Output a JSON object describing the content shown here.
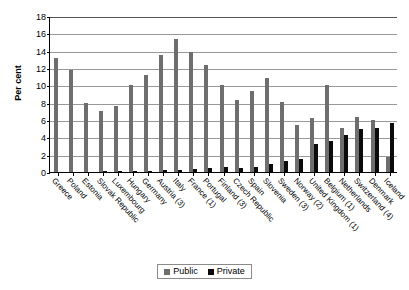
{
  "chart_data": {
    "type": "bar",
    "title": "",
    "xlabel": "",
    "ylabel": "Per cent",
    "ylim": [
      0,
      18
    ],
    "yticks": [
      0,
      2,
      4,
      6,
      8,
      10,
      12,
      14,
      16,
      18
    ],
    "grid": true,
    "legend_position": "bottom",
    "categories": [
      "Greece",
      "Poland",
      "Estonia",
      "Slovak Republic",
      "Luxembourg",
      "Hungary",
      "Germany",
      "Austria (3)",
      "Italy",
      "France (1)",
      "Portugal",
      "Finland (3)",
      "Czech Republic",
      "Spain",
      "Slovenia",
      "Sweden (3)",
      "Norway (2)",
      "United Kingdom (1)",
      "Belgium (1)",
      "Netherlands",
      "Switzerland (4)",
      "Denmark",
      "Iceland"
    ],
    "series": [
      {
        "name": "Public",
        "color": "#6e6e6e",
        "values": [
          13.1,
          11.8,
          8.0,
          7.0,
          7.6,
          10.0,
          11.2,
          13.5,
          15.4,
          13.8,
          12.3,
          10.0,
          8.3,
          9.3,
          10.9,
          8.1,
          5.4,
          6.2,
          10.0,
          5.1,
          6.3,
          6.0,
          1.7
        ]
      },
      {
        "name": "Private",
        "color": "#0b0b0b",
        "values": [
          0.0,
          0.0,
          0.0,
          0.1,
          0.1,
          0.1,
          0.15,
          0.2,
          0.2,
          0.3,
          0.45,
          0.6,
          0.5,
          0.6,
          0.9,
          1.3,
          1.55,
          3.2,
          3.6,
          4.3,
          5.0,
          5.1,
          5.7
        ]
      }
    ]
  },
  "legend": {
    "items": [
      {
        "label": "Public",
        "color": "#6e6e6e"
      },
      {
        "label": "Private",
        "color": "#0b0b0b"
      }
    ]
  }
}
